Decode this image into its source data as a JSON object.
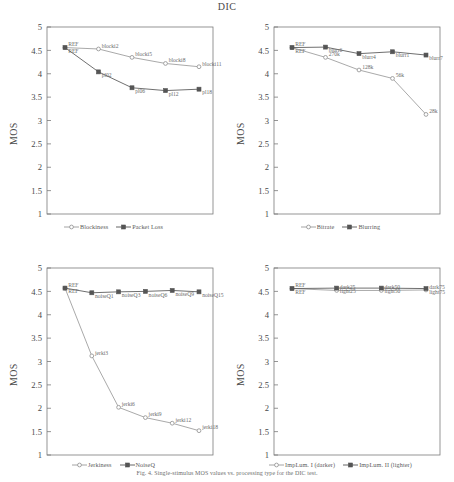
{
  "figure": {
    "title": "DIC",
    "caption": "Fig. 4. Single-stimulus MOS values vs. processing type for the DIC test.",
    "axis": {
      "ylabel": "MOS",
      "yticks": [
        "1",
        "1.5",
        "2",
        "2.5",
        "3",
        "3.5",
        "4",
        "4.5",
        "5"
      ],
      "ymin": 1,
      "ymax": 5
    },
    "colors": {
      "series_light": "#9a9a9a",
      "series_dark": "#555555",
      "axis": "#7a7a7a",
      "text": "#4a4a4a"
    }
  },
  "chart_data": [
    {
      "panel": "top-left",
      "type": "line",
      "title": "",
      "xlabel": "",
      "ylabel": "MOS",
      "ylim": [
        1,
        5
      ],
      "yticks": [
        1,
        1.5,
        2,
        2.5,
        3,
        3.5,
        4,
        4.5,
        5
      ],
      "grid": false,
      "legend_position": "bottom-center",
      "series": [
        {
          "name": "Blockiness",
          "marker": "open-circle",
          "color": "#9a9a9a",
          "x": [
            0,
            1,
            2,
            3,
            4
          ],
          "point_labels": [
            "REF",
            "blocki2",
            "blocki5",
            "blocki8",
            "blocki11"
          ],
          "values": [
            4.56,
            4.53,
            4.35,
            4.22,
            4.15
          ]
        },
        {
          "name": "Packet Loss",
          "marker": "filled-square",
          "color": "#555555",
          "x": [
            0,
            1,
            2,
            3,
            4
          ],
          "point_labels": [
            "REF",
            "pl02",
            "pl06",
            "pl12",
            "pl18"
          ],
          "values": [
            4.56,
            4.04,
            3.7,
            3.64,
            3.67
          ]
        }
      ]
    },
    {
      "panel": "top-right",
      "type": "line",
      "title": "",
      "xlabel": "",
      "ylabel": "MOS",
      "ylim": [
        1,
        5
      ],
      "yticks": [
        1,
        1.5,
        2,
        2.5,
        3,
        3.5,
        4,
        4.5,
        5
      ],
      "grid": false,
      "legend_position": "bottom-center",
      "series": [
        {
          "name": "Bitrate",
          "marker": "open-circle",
          "color": "#9a9a9a",
          "x": [
            0,
            1,
            2,
            3,
            4
          ],
          "point_labels": [
            "REF",
            "270k",
            "128k",
            "56k",
            "28k"
          ],
          "values": [
            4.56,
            4.35,
            4.08,
            3.9,
            3.13
          ]
        },
        {
          "name": "Blurring",
          "marker": "filled-square",
          "color": "#555555",
          "x": [
            0,
            1,
            2,
            3,
            4
          ],
          "point_labels": [
            "REF",
            "blurr6",
            "blurr4",
            "blurr1",
            "blurr7"
          ],
          "values": [
            4.56,
            4.57,
            4.43,
            4.47,
            4.4
          ]
        }
      ]
    },
    {
      "panel": "bottom-left",
      "type": "line",
      "title": "",
      "xlabel": "",
      "ylabel": "MOS",
      "ylim": [
        1,
        5
      ],
      "yticks": [
        1,
        1.5,
        2,
        2.5,
        3,
        3.5,
        4,
        4.5,
        5
      ],
      "grid": false,
      "legend_position": "bottom-center",
      "series": [
        {
          "name": "Jerkiness",
          "marker": "open-circle",
          "color": "#9a9a9a",
          "x": [
            0,
            1,
            2,
            3,
            4,
            5
          ],
          "point_labels": [
            "REF",
            "jerki3",
            "jerki6",
            "jerki9",
            "jerki12",
            "jerki18"
          ],
          "values": [
            4.57,
            3.12,
            2.02,
            1.8,
            1.68,
            1.52
          ]
        },
        {
          "name": "NoiseQ",
          "marker": "filled-square",
          "color": "#555555",
          "x": [
            0,
            1,
            2,
            3,
            4,
            5
          ],
          "point_labels": [
            "REF",
            "noiseQ1",
            "noiseQ3",
            "noiseQ6",
            "noiseQ9",
            "noiseQ15"
          ],
          "values": [
            4.57,
            4.47,
            4.49,
            4.5,
            4.52,
            4.49
          ]
        }
      ]
    },
    {
      "panel": "bottom-right",
      "type": "line",
      "title": "",
      "xlabel": "",
      "ylabel": "MOS",
      "ylim": [
        1,
        5
      ],
      "yticks": [
        1,
        1.5,
        2,
        2.5,
        3,
        3.5,
        4,
        4.5,
        5
      ],
      "grid": false,
      "legend_position": "bottom-center",
      "series": [
        {
          "name": "ImpLum. I (darker)",
          "marker": "open-circle",
          "color": "#9a9a9a",
          "x": [
            0,
            1,
            2,
            3
          ],
          "point_labels": [
            "REF",
            "dark25",
            "dark50",
            "dark75"
          ],
          "values": [
            4.56,
            4.52,
            4.52,
            4.53
          ]
        },
        {
          "name": "ImpLum. II (lighter)",
          "marker": "filled-square",
          "color": "#555555",
          "x": [
            0,
            1,
            2,
            3
          ],
          "point_labels": [
            "REF",
            "light25",
            "light50",
            "light75"
          ],
          "values": [
            4.56,
            4.57,
            4.57,
            4.56
          ]
        }
      ]
    }
  ]
}
